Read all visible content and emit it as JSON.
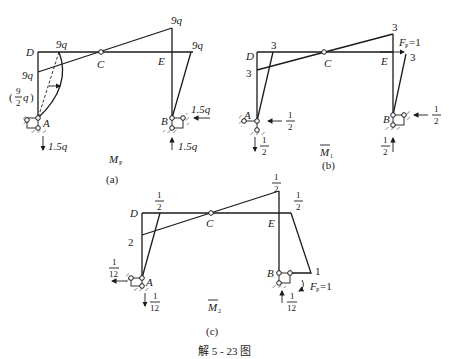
{
  "figure_caption": "解 5 - 23 图",
  "panels": {
    "a": {
      "label": "(a)",
      "diagram_title": "M",
      "diagram_title_sub": "P",
      "nodes": {
        "D": "D",
        "C": "C",
        "E": "E",
        "A": "A",
        "B": "B"
      },
      "values": {
        "top_right": "9q",
        "D_top": "9q",
        "D_left": "9q",
        "E_right": "9q",
        "parabola_mid": "(9/2 q)",
        "parabola_num": "9",
        "parabola_den": "2",
        "parabola_q": "q",
        "B_horizontal": "1.5q",
        "A_vertical": "1.5q",
        "B_vertical": "1.5q"
      }
    },
    "b": {
      "label": "(b)",
      "diagram_title": "M",
      "diagram_title_sub": "1",
      "nodes": {
        "D": "D",
        "C": "C",
        "E": "E",
        "A": "A",
        "B": "B"
      },
      "values": {
        "top_right": "3",
        "D_top": "3",
        "D_left": "3",
        "E_right": "3",
        "load": "F",
        "load_sub": "P",
        "load_value": "=1",
        "A_horizontal_num": "1",
        "A_horizontal_den": "2",
        "A_vertical_num": "1",
        "A_vertical_den": "2",
        "B_horizontal_num": "1",
        "B_horizontal_den": "2",
        "B_vertical_num": "1",
        "B_vertical_den": "2"
      }
    },
    "c": {
      "label": "(c)",
      "diagram_title": "M",
      "diagram_title_sub": "2",
      "nodes": {
        "D": "D",
        "C": "C",
        "E": "E",
        "A": "A",
        "B": "B"
      },
      "values": {
        "top_right_num": "1",
        "top_right_den": "2",
        "D_top_num": "1",
        "D_top_den": "2",
        "D_left": "2",
        "E_right_num": "1",
        "E_right_den": "2",
        "B_right": "1",
        "load": "F",
        "load_sub": "P",
        "load_value": "=1",
        "A_horizontal_num": "1",
        "A_horizontal_den": "12",
        "A_vertical_num": "1",
        "A_vertical_den": "12",
        "B_vertical_num": "1",
        "B_vertical_den": "12"
      }
    }
  }
}
